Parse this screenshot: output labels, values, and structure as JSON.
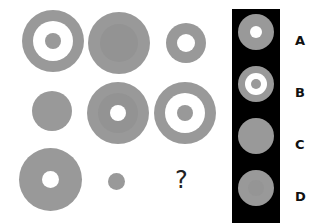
{
  "puzzle": {
    "question_mark": "?",
    "grid": [
      {
        "row": 1,
        "col": 1,
        "description": "gray ring with white band and small gray center dot"
      },
      {
        "row": 1,
        "col": 2,
        "description": "large gray circle with slightly darker inner disc"
      },
      {
        "row": 1,
        "col": 3,
        "description": "small gray ring with white center"
      },
      {
        "row": 2,
        "col": 1,
        "description": "medium solid gray circle"
      },
      {
        "row": 2,
        "col": 2,
        "description": "gray circle with darker inner disc and white center"
      },
      {
        "row": 2,
        "col": 3,
        "description": "gray ring with white band and gray center dot"
      },
      {
        "row": 3,
        "col": 1,
        "description": "large gray disc with white center"
      },
      {
        "row": 3,
        "col": 2,
        "description": "small solid gray dot"
      },
      {
        "row": 3,
        "col": 3,
        "description": "question mark"
      }
    ],
    "options": [
      {
        "label": "A",
        "description": "gray circle with small white center"
      },
      {
        "label": "B",
        "description": "gray ring with white band and gray center dot"
      },
      {
        "label": "C",
        "description": "solid gray circle"
      },
      {
        "label": "D",
        "description": "gray circle with faint darker inner disc"
      }
    ],
    "colors": {
      "shape_gray": "#999999",
      "inner_gray": "#939393",
      "panel_bg": "#000000",
      "background": "#ffffff"
    }
  }
}
